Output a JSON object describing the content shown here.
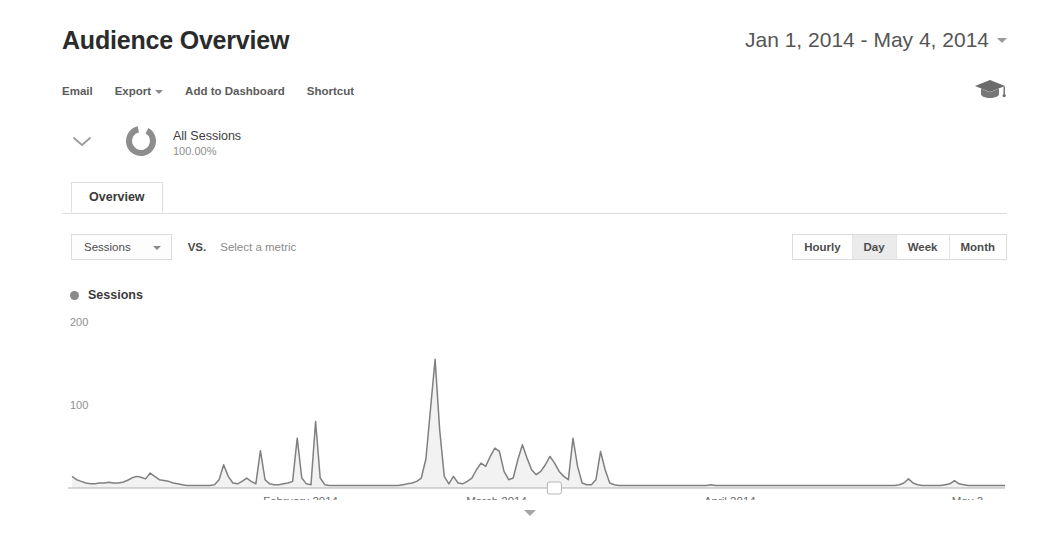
{
  "header": {
    "title": "Audience Overview",
    "date_range": "Jan 1, 2014 - May 4, 2014",
    "date_range_caret": "chevron-down-icon"
  },
  "toolbar": {
    "items": [
      {
        "label": "Email",
        "has_caret": false
      },
      {
        "label": "Export",
        "has_caret": true
      },
      {
        "label": "Add to Dashboard",
        "has_caret": false
      },
      {
        "label": "Shortcut",
        "has_caret": false
      }
    ],
    "right_icon": "graduation-cap-icon"
  },
  "segment": {
    "expander_icon": "chevron-down-icon",
    "donut_icon": "donut-chart-icon",
    "name": "All Sessions",
    "percent": "100.00%"
  },
  "tabs": [
    {
      "label": "Overview",
      "active": true
    }
  ],
  "metric_controls": {
    "primary_metric": "Sessions",
    "primary_metric_caret": "chevron-down-icon",
    "vs_label": "VS.",
    "secondary_metric_placeholder": "Select a metric",
    "granularity": [
      {
        "label": "Hourly",
        "active": false
      },
      {
        "label": "Day",
        "active": true
      },
      {
        "label": "Week",
        "active": false
      },
      {
        "label": "Month",
        "active": false
      }
    ]
  },
  "legend": {
    "series_label": "Sessions",
    "dot_color": "#8a8a8a"
  },
  "footer": {
    "expand_icon": "chevron-down-icon"
  },
  "chart_data": {
    "type": "line",
    "title": "Sessions",
    "xlabel": "",
    "ylabel": "Sessions",
    "ylim": [
      0,
      200
    ],
    "yticks": [
      100,
      200
    ],
    "ytick_labels": [
      "100",
      "200"
    ],
    "grid": false,
    "legend_position": "top-left",
    "fill": true,
    "line_color": "#808080",
    "fill_color": "#f2f2f2",
    "axis_color": "#b0b0b0",
    "xtick_labels": [
      "February 2014",
      "March 2014",
      "April 2014",
      "May 2..."
    ],
    "xtick_positions": [
      0.245,
      0.455,
      0.705,
      0.965
    ],
    "annotation_marker": {
      "x_fraction": 0.517,
      "label": ""
    },
    "x_start": "Jan 1, 2014",
    "x_end": "May 4, 2014",
    "series": [
      {
        "name": "Sessions",
        "values": [
          14,
          10,
          8,
          6,
          5,
          5,
          6,
          6,
          7,
          6,
          6,
          7,
          9,
          12,
          14,
          13,
          11,
          18,
          14,
          10,
          9,
          8,
          6,
          5,
          4,
          3,
          3,
          3,
          3,
          3,
          3,
          4,
          10,
          28,
          14,
          6,
          5,
          8,
          12,
          8,
          5,
          45,
          10,
          5,
          4,
          4,
          5,
          6,
          8,
          60,
          12,
          5,
          4,
          80,
          12,
          4,
          3,
          3,
          3,
          3,
          3,
          3,
          3,
          3,
          3,
          3,
          3,
          3,
          3,
          3,
          3,
          3,
          4,
          5,
          6,
          8,
          12,
          35,
          95,
          155,
          70,
          14,
          5,
          14,
          6,
          5,
          8,
          12,
          22,
          30,
          26,
          38,
          48,
          44,
          20,
          10,
          12,
          34,
          52,
          36,
          22,
          16,
          20,
          28,
          38,
          30,
          20,
          14,
          10,
          60,
          26,
          6,
          4,
          4,
          10,
          44,
          22,
          6,
          4,
          3,
          3,
          3,
          3,
          3,
          3,
          3,
          3,
          3,
          3,
          3,
          3,
          3,
          3,
          3,
          3,
          3,
          3,
          3,
          3,
          4,
          3,
          3,
          3,
          3,
          3,
          3,
          3,
          3,
          3,
          3,
          3,
          3,
          3,
          3,
          3,
          3,
          3,
          3,
          3,
          3,
          3,
          3,
          3,
          3,
          3,
          3,
          3,
          3,
          3,
          3,
          3,
          3,
          3,
          3,
          3,
          3,
          3,
          3,
          3,
          3,
          4,
          6,
          11,
          6,
          4,
          3,
          3,
          3,
          3,
          3,
          4,
          5,
          9,
          5,
          4,
          3,
          3,
          3,
          3,
          3,
          3,
          3,
          3,
          3
        ]
      }
    ]
  }
}
